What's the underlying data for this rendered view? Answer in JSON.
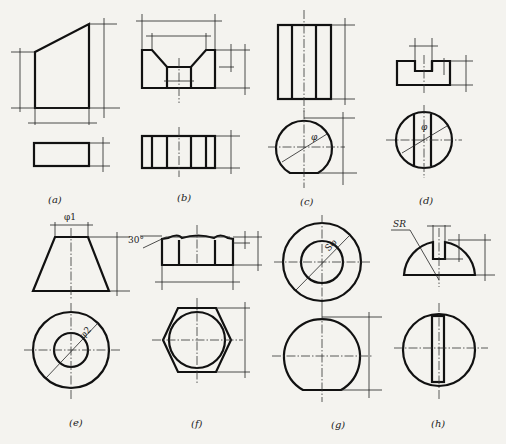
{
  "figure": {
    "stroke_color": "#111111",
    "background_color": "#f4f3ef",
    "panels": [
      {
        "id": "a",
        "caption": "(a)",
        "shape": "truncated prism (sloped top)"
      },
      {
        "id": "b",
        "caption": "(b)",
        "shape": "block with V-groove"
      },
      {
        "id": "c",
        "caption": "(c)",
        "shape": "cylinder with flat cut",
        "dim_labels": [
          "φ"
        ]
      },
      {
        "id": "d",
        "caption": "(d)",
        "shape": "cylinder with slot",
        "dim_labels": [
          "φ"
        ]
      },
      {
        "id": "e",
        "caption": "(e)",
        "shape": "frustum of cone",
        "dim_labels": [
          "φ1",
          "φ2"
        ]
      },
      {
        "id": "f",
        "caption": "(f)",
        "shape": "hexagonal nut blank",
        "dim_labels": [
          "30°"
        ]
      },
      {
        "id": "g",
        "caption": "(g)",
        "shape": "truncated sphere",
        "dim_labels": [
          "Sφ"
        ]
      },
      {
        "id": "h",
        "caption": "(h)",
        "shape": "slotted hemisphere",
        "dim_labels": [
          "SR"
        ]
      }
    ]
  }
}
